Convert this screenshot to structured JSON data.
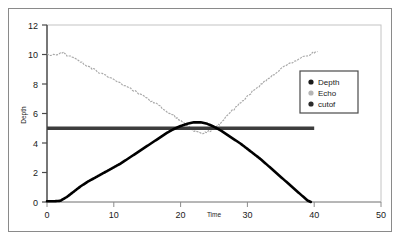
{
  "chart_data": {
    "type": "line",
    "title": "",
    "xlabel": "Time",
    "ylabel": "Depth",
    "xlim": [
      0,
      50
    ],
    "ylim": [
      0,
      12
    ],
    "xticks": [
      0,
      10,
      20,
      30,
      40,
      50
    ],
    "yticks": [
      0,
      2,
      4,
      6,
      8,
      10,
      12
    ],
    "grid": false,
    "legend_position": "upper right",
    "series": [
      {
        "name": "Depth",
        "color": "#000000",
        "style": "solid-thick",
        "marker": "circle",
        "x": [
          0,
          1,
          2,
          3,
          4,
          5,
          6,
          7,
          8,
          9,
          10,
          11,
          12,
          13,
          14,
          15,
          16,
          17,
          18,
          19,
          20,
          21,
          22,
          23,
          24,
          25,
          26,
          27,
          28,
          29,
          30,
          31,
          32,
          33,
          34,
          35,
          36,
          37,
          38,
          39,
          39.5
        ],
        "y": [
          0.05,
          0.05,
          0.08,
          0.35,
          0.7,
          1.05,
          1.35,
          1.6,
          1.85,
          2.1,
          2.35,
          2.6,
          2.9,
          3.2,
          3.5,
          3.8,
          4.1,
          4.4,
          4.7,
          4.95,
          5.15,
          5.3,
          5.4,
          5.4,
          5.3,
          5.1,
          4.85,
          4.55,
          4.25,
          3.95,
          3.6,
          3.25,
          2.9,
          2.5,
          2.1,
          1.7,
          1.3,
          0.9,
          0.5,
          0.1,
          0.0
        ]
      },
      {
        "name": "Echo",
        "color": "#a8a8a8",
        "style": "noisy-dashed",
        "marker": "circle",
        "x": [
          0,
          1,
          2,
          2.5,
          3,
          4,
          5,
          6,
          7,
          8,
          9,
          10,
          11,
          12,
          13,
          14,
          15,
          16,
          17,
          18,
          19,
          20,
          21,
          22,
          23,
          23.5,
          24,
          24.5,
          25,
          25.5,
          26,
          27,
          28,
          29,
          30,
          31,
          32,
          33,
          34,
          35,
          36,
          37,
          38,
          39,
          40,
          40.5
        ],
        "y": [
          10.0,
          10.0,
          10.05,
          10.1,
          9.95,
          9.75,
          9.5,
          9.25,
          9.0,
          8.75,
          8.5,
          8.3,
          8.05,
          7.8,
          7.55,
          7.3,
          7.0,
          6.75,
          6.45,
          6.15,
          5.85,
          5.5,
          5.15,
          4.85,
          4.7,
          4.7,
          4.75,
          4.85,
          4.95,
          5.15,
          5.35,
          5.85,
          6.3,
          6.75,
          7.15,
          7.6,
          7.95,
          8.3,
          8.65,
          9.0,
          9.3,
          9.55,
          9.8,
          9.95,
          10.15,
          10.2
        ]
      },
      {
        "name": "cutof",
        "color": "#3d3d3d",
        "style": "solid-very-thick",
        "marker": "circle",
        "value": 5,
        "x": [
          0,
          40
        ],
        "y": [
          5,
          5
        ]
      }
    ]
  },
  "axes": {
    "y_title": "Depth",
    "x_title": "Time",
    "y_tick_labels": [
      "0",
      "2",
      "4",
      "6",
      "8",
      "10",
      "12"
    ],
    "x_tick_labels": [
      "0",
      "10",
      "20",
      "30",
      "40",
      "50"
    ]
  },
  "legend": {
    "entries": [
      {
        "label": "Depth",
        "color": "#1a1a1a"
      },
      {
        "label": "Echo",
        "color": "#b5b5b5"
      },
      {
        "label": "cutof",
        "color": "#2b2b2b"
      }
    ]
  },
  "colors": {
    "frame": "#8a8a8a",
    "plot_border": "#b9b9b9",
    "axis": "#4a4a4a",
    "depth": "#000000",
    "echo": "#a8a8a8",
    "cutoff": "#3d3d3d",
    "background": "#ffffff"
  }
}
